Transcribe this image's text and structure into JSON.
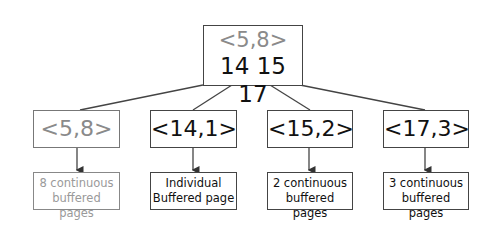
{
  "root": {
    "range_label": "<5,8>",
    "keys_label": "14 15 17"
  },
  "children": [
    {
      "label": "<5,8>",
      "leaf_line1": "8 continuous",
      "leaf_line2": "buffered pages",
      "muted": true
    },
    {
      "label": "<14,1>",
      "leaf_line1": "Individual",
      "leaf_line2": "Buffered page",
      "muted": false
    },
    {
      "label": "<15,2>",
      "leaf_line1": "2 continuous",
      "leaf_line2": "buffered pages",
      "muted": false
    },
    {
      "label": "<17,3>",
      "leaf_line1": "3 continuous",
      "leaf_line2": "buffered pages",
      "muted": false
    }
  ],
  "colors": {
    "muted_text": "#8a8a8a",
    "text": "#111111",
    "line": "#444444"
  }
}
